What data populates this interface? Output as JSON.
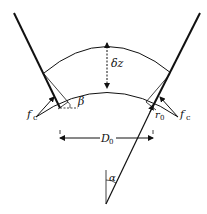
{
  "diagram": {
    "labels": {
      "delta_z": "δz",
      "beta": "β",
      "f_c_left": "f",
      "f_c_left_sub": "c",
      "f_c_right": "f",
      "f_c_right_sub": "c",
      "r0": "r",
      "r0_sub": "0",
      "D0": "D",
      "D0_sub": "0",
      "alpha": "α"
    },
    "colors": {
      "stroke": "#111111",
      "background": "#ffffff"
    }
  }
}
